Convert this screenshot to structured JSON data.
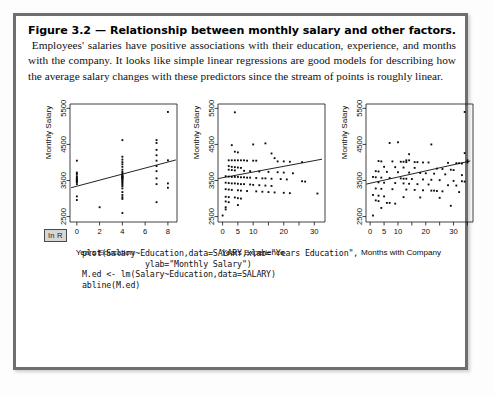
{
  "figure": {
    "label": "Figure 3.2",
    "dash": "—",
    "title": "Relationship between monthly salary and other factors.",
    "body": "Employees' salaries have positive associations with their education, experience, and months with the company. It looks like simple linear regressions are good models for describing how the average salary changes with these predictors since the stream of points is roughly linear."
  },
  "code_panel": {
    "badge": "In R",
    "code": "plot(Salary~Education,data=SALARY,xlab=\"Years Education\",\n             ylab=\"Monthly Salary\")\nM.ed <- lm(Salary~Education,data=SALARY)\nabline(M.ed)"
  },
  "chart_data": [
    {
      "type": "scatter",
      "title": "",
      "xlabel": "Years Education",
      "ylabel": "Monthly Salary",
      "xlim": [
        -0.6,
        8.8
      ],
      "ylim": [
        2350,
        5620
      ],
      "xticks": [
        0,
        2,
        4,
        6,
        8
      ],
      "yticks": [
        2500,
        3500,
        4500,
        5500
      ],
      "grid": false,
      "legend": "none",
      "regression_line": {
        "x": [
          -0.5,
          8.7
        ],
        "y": [
          3300,
          4070
        ]
      },
      "points": [
        [
          0,
          4050
        ],
        [
          0,
          3680
        ],
        [
          0,
          3620
        ],
        [
          0,
          3560
        ],
        [
          0,
          3520
        ],
        [
          0,
          3490
        ],
        [
          0,
          3450
        ],
        [
          0,
          3400
        ],
        [
          0,
          3060
        ],
        [
          0,
          2960
        ],
        [
          0,
          3720
        ],
        [
          0,
          3580
        ],
        [
          0,
          3530
        ],
        [
          0,
          3470
        ],
        [
          2,
          2760
        ],
        [
          4,
          4620
        ],
        [
          4,
          4160
        ],
        [
          4,
          4080
        ],
        [
          4,
          4010
        ],
        [
          4,
          3950
        ],
        [
          4,
          3880
        ],
        [
          4,
          3800
        ],
        [
          4,
          3740
        ],
        [
          4,
          3700
        ],
        [
          4,
          3660
        ],
        [
          4,
          3630
        ],
        [
          4,
          3600
        ],
        [
          4,
          3570
        ],
        [
          4,
          3540
        ],
        [
          4,
          3510
        ],
        [
          4,
          3480
        ],
        [
          4,
          3450
        ],
        [
          4,
          3420
        ],
        [
          4,
          3380
        ],
        [
          4,
          3340
        ],
        [
          4,
          3280
        ],
        [
          4,
          3180
        ],
        [
          4,
          3100
        ],
        [
          4,
          3040
        ],
        [
          4,
          2990
        ],
        [
          4,
          2600
        ],
        [
          4,
          3560
        ],
        [
          4,
          3590
        ],
        [
          4,
          3620
        ],
        [
          7,
          4620
        ],
        [
          7,
          4540
        ],
        [
          7,
          4350
        ],
        [
          7,
          4200
        ],
        [
          7,
          4050
        ],
        [
          7,
          3900
        ],
        [
          7,
          3760
        ],
        [
          7,
          3560
        ],
        [
          7,
          3400
        ],
        [
          7,
          2900
        ],
        [
          8,
          5400
        ],
        [
          8,
          4060
        ],
        [
          8,
          3420
        ],
        [
          8,
          3300
        ]
      ]
    },
    {
      "type": "scatter",
      "title": "",
      "xlabel": "Years Experience",
      "ylabel": "Monthly Salary",
      "xlim": [
        -1.5,
        33.5
      ],
      "ylim": [
        2350,
        5620
      ],
      "xticks": [
        0,
        5,
        10,
        15,
        20,
        25,
        30
      ],
      "xticklabels": [
        "0",
        "5",
        "10",
        "",
        "20",
        "",
        "30"
      ],
      "yticks": [
        2500,
        3500,
        4500,
        5500
      ],
      "grid": false,
      "legend": "none",
      "regression_line": {
        "x": [
          -1.4,
          32.5
        ],
        "y": [
          3555,
          4090
        ]
      },
      "points": [
        [
          4,
          5390
        ],
        [
          3,
          4480
        ],
        [
          10,
          4500
        ],
        [
          14,
          4530
        ],
        [
          4,
          4300
        ],
        [
          5,
          4280
        ],
        [
          16,
          4250
        ],
        [
          17,
          4120
        ],
        [
          2,
          4060
        ],
        [
          3,
          4060
        ],
        [
          4,
          4060
        ],
        [
          5,
          4060
        ],
        [
          6,
          4060
        ],
        [
          7,
          4060
        ],
        [
          8,
          4050
        ],
        [
          10,
          4050
        ],
        [
          11,
          4050
        ],
        [
          18,
          4030
        ],
        [
          20,
          4030
        ],
        [
          22,
          4020
        ],
        [
          26,
          4010
        ],
        [
          2,
          3900
        ],
        [
          3,
          3880
        ],
        [
          4,
          3870
        ],
        [
          5,
          3860
        ],
        [
          6,
          3850
        ],
        [
          2,
          3800
        ],
        [
          3,
          3790
        ],
        [
          4,
          3780
        ],
        [
          7,
          3770
        ],
        [
          9,
          3760
        ],
        [
          12,
          3750
        ],
        [
          15,
          3740
        ],
        [
          18,
          3730
        ],
        [
          20,
          3720
        ],
        [
          23,
          3700
        ],
        [
          1,
          3620
        ],
        [
          2,
          3610
        ],
        [
          3,
          3600
        ],
        [
          4,
          3600
        ],
        [
          5,
          3600
        ],
        [
          6,
          3590
        ],
        [
          7,
          3590
        ],
        [
          8,
          3580
        ],
        [
          9,
          3580
        ],
        [
          11,
          3570
        ],
        [
          13,
          3560
        ],
        [
          14,
          3560
        ],
        [
          16,
          3550
        ],
        [
          19,
          3540
        ],
        [
          21,
          3530
        ],
        [
          26,
          3480
        ],
        [
          27,
          3470
        ],
        [
          1,
          3440
        ],
        [
          2,
          3430
        ],
        [
          3,
          3420
        ],
        [
          4,
          3420
        ],
        [
          5,
          3410
        ],
        [
          6,
          3400
        ],
        [
          7,
          3400
        ],
        [
          9,
          3390
        ],
        [
          10,
          3380
        ],
        [
          12,
          3370
        ],
        [
          14,
          3360
        ],
        [
          16,
          3350
        ],
        [
          1,
          3260
        ],
        [
          2,
          3250
        ],
        [
          3,
          3240
        ],
        [
          5,
          3230
        ],
        [
          6,
          3220
        ],
        [
          8,
          3210
        ],
        [
          11,
          3200
        ],
        [
          13,
          3190
        ],
        [
          15,
          3180
        ],
        [
          17,
          3170
        ],
        [
          20,
          3160
        ],
        [
          22,
          3150
        ],
        [
          31,
          3140
        ],
        [
          1,
          3050
        ],
        [
          2,
          3040
        ],
        [
          4,
          3030
        ],
        [
          5,
          3010
        ],
        [
          6,
          3000
        ],
        [
          1,
          2920
        ],
        [
          2,
          2900
        ],
        [
          5,
          2820
        ],
        [
          1,
          2760
        ],
        [
          1,
          2700
        ],
        [
          0,
          2530
        ]
      ]
    },
    {
      "type": "scatter",
      "title": "",
      "xlabel": "Months with Company",
      "ylabel": "Monthly Salary",
      "xlim": [
        -1.5,
        37
      ],
      "ylim": [
        2350,
        5620
      ],
      "xticks": [
        0,
        5,
        10,
        15,
        20,
        25,
        30,
        35
      ],
      "xticklabels": [
        "0",
        "5",
        "10",
        "",
        "20",
        "",
        "30",
        ""
      ],
      "yticks": [
        2500,
        3500,
        4500,
        5500
      ],
      "grid": false,
      "legend": "none",
      "regression_line": {
        "x": [
          -1.4,
          36
        ],
        "y": [
          3400,
          4040
        ]
      },
      "points": [
        [
          34,
          5400
        ],
        [
          7,
          4540
        ],
        [
          10,
          4560
        ],
        [
          22,
          4500
        ],
        [
          34,
          4260
        ],
        [
          14,
          4230
        ],
        [
          13,
          4060
        ],
        [
          14,
          4060
        ],
        [
          35,
          4060
        ],
        [
          35,
          4000
        ],
        [
          3,
          4040
        ],
        [
          4,
          4030
        ],
        [
          8,
          4030
        ],
        [
          11,
          4020
        ],
        [
          12,
          4020
        ],
        [
          13,
          4010
        ],
        [
          16,
          4010
        ],
        [
          17,
          4010
        ],
        [
          19,
          4000
        ],
        [
          21,
          4000
        ],
        [
          28,
          3990
        ],
        [
          31,
          3980
        ],
        [
          32,
          3980
        ],
        [
          33,
          3970
        ],
        [
          5,
          3880
        ],
        [
          9,
          3870
        ],
        [
          12,
          3860
        ],
        [
          16,
          3850
        ],
        [
          24,
          3830
        ],
        [
          26,
          3820
        ],
        [
          29,
          3800
        ],
        [
          30,
          3790
        ],
        [
          2,
          3760
        ],
        [
          3,
          3750
        ],
        [
          6,
          3740
        ],
        [
          10,
          3730
        ],
        [
          14,
          3720
        ],
        [
          18,
          3710
        ],
        [
          20,
          3700
        ],
        [
          23,
          3690
        ],
        [
          27,
          3670
        ],
        [
          33,
          3650
        ],
        [
          1,
          3600
        ],
        [
          2,
          3590
        ],
        [
          4,
          3580
        ],
        [
          7,
          3570
        ],
        [
          11,
          3560
        ],
        [
          12,
          3550
        ],
        [
          13,
          3550
        ],
        [
          15,
          3540
        ],
        [
          19,
          3530
        ],
        [
          22,
          3520
        ],
        [
          25,
          3510
        ],
        [
          30,
          3490
        ],
        [
          33,
          3480
        ],
        [
          34,
          3470
        ],
        [
          3,
          3450
        ],
        [
          5,
          3440
        ],
        [
          9,
          3430
        ],
        [
          12,
          3420
        ],
        [
          14,
          3410
        ],
        [
          17,
          3400
        ],
        [
          21,
          3390
        ],
        [
          28,
          3370
        ],
        [
          31,
          3360
        ],
        [
          2,
          3280
        ],
        [
          4,
          3270
        ],
        [
          8,
          3260
        ],
        [
          13,
          3250
        ],
        [
          16,
          3240
        ],
        [
          19,
          3230
        ],
        [
          22,
          3220
        ],
        [
          23,
          3220
        ],
        [
          24,
          3210
        ],
        [
          26,
          3200
        ],
        [
          32,
          3180
        ],
        [
          1,
          3100
        ],
        [
          3,
          3080
        ],
        [
          5,
          3060
        ],
        [
          12,
          3040
        ],
        [
          18,
          3030
        ],
        [
          25,
          3020
        ],
        [
          2,
          2950
        ],
        [
          3,
          2930
        ],
        [
          6,
          2880
        ],
        [
          7,
          2880
        ],
        [
          9,
          2860
        ],
        [
          29,
          2800
        ],
        [
          4,
          2740
        ],
        [
          1,
          2530
        ]
      ]
    }
  ]
}
